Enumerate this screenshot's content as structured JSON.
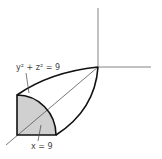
{
  "figure": {
    "labels": {
      "cylinder": "y² + z² = 9",
      "plane": "x = 9"
    },
    "colors": {
      "stroke": "#111111",
      "axis": "#555555",
      "fill": "#d0d0d0",
      "background": "#ffffff"
    }
  }
}
